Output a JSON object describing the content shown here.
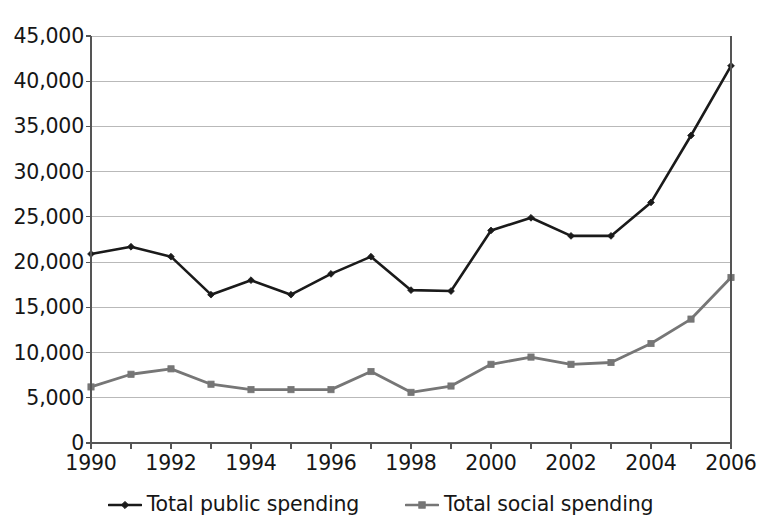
{
  "chart_data": {
    "type": "line",
    "title": "",
    "subtitle": "",
    "xlabel": "",
    "ylabel": "",
    "x": [
      1990,
      1991,
      1992,
      1993,
      1994,
      1995,
      1996,
      1997,
      1998,
      1999,
      2000,
      2001,
      2002,
      2003,
      2004,
      2005,
      2006
    ],
    "categories": [
      "1990",
      "1991",
      "1992",
      "1993",
      "1994",
      "1995",
      "1996",
      "1997",
      "1998",
      "1999",
      "2000",
      "2001",
      "2002",
      "2003",
      "2004",
      "2005",
      "2006"
    ],
    "series": [
      {
        "name": "Total public spending",
        "color": "#1a1a1a",
        "marker": "diamond",
        "values": [
          20900,
          21700,
          20600,
          16400,
          18000,
          16400,
          18700,
          20600,
          16900,
          16800,
          23500,
          24900,
          22900,
          22900,
          26600,
          34000,
          41700
        ]
      },
      {
        "name": "Total social spending",
        "color": "#767676",
        "marker": "square",
        "values": [
          6200,
          7600,
          8200,
          6500,
          5900,
          5900,
          5900,
          7900,
          5600,
          6300,
          8700,
          9500,
          8700,
          8900,
          11000,
          13700,
          18300
        ]
      }
    ],
    "xlim": [
      1990,
      2006
    ],
    "ylim": [
      0,
      45000
    ],
    "ytick_values": [
      0,
      5000,
      10000,
      15000,
      20000,
      25000,
      30000,
      35000,
      40000,
      45000
    ],
    "ytick_labels": [
      "0",
      "5,000",
      "10,000",
      "15,000",
      "20,000",
      "25,000",
      "30,000",
      "35,000",
      "40,000",
      "45,000"
    ],
    "xtick_values": [
      1990,
      1992,
      1994,
      1996,
      1998,
      2000,
      2002,
      2004,
      2006
    ],
    "xtick_labels": [
      "1990",
      "1992",
      "1994",
      "1996",
      "1998",
      "2000",
      "2002",
      "2004",
      "2006"
    ],
    "xminor_ticks_every": 1,
    "grid": {
      "horizontal": true,
      "vertical": false,
      "color": "#b9b9b9"
    },
    "legend": {
      "position": "bottom-center",
      "entries": [
        "Total public spending",
        "Total social spending"
      ]
    },
    "axis_color": "#555555",
    "background": "#ffffff"
  }
}
